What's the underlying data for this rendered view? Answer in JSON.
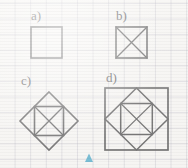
{
  "page": {
    "background_color": "#f8f7f5",
    "grid_color": "#9694aa",
    "grid_spacing_px": 15.6,
    "ink_color": "#2e2e30",
    "marker_color": "#2f9ec4"
  },
  "labels": {
    "a": "a)",
    "b": "b)",
    "c": "c)",
    "d": "d)"
  },
  "figures": [
    {
      "id": "a",
      "name": "plain-square",
      "description": "A plain upright square outline.",
      "bounds": {
        "x": 31,
        "y": 27,
        "width": 31,
        "height": 31
      },
      "elements": [
        "outer-square"
      ]
    },
    {
      "id": "b",
      "name": "square-with-diagonals",
      "description": "An upright square with both diagonals drawn forming an X.",
      "bounds": {
        "x": 116,
        "y": 27,
        "width": 31,
        "height": 31
      },
      "elements": [
        "outer-square",
        "diagonal-x"
      ]
    },
    {
      "id": "c",
      "name": "diamond-with-inscribed-square-and-x",
      "description": "A diamond (square rotated 45 degrees) containing an inscribed upright square whose corners touch the diamond edge midpoints, with both diagonals of the inner square drawn.",
      "bounds": {
        "x": 20,
        "y": 92,
        "width": 58,
        "height": 58
      },
      "elements": [
        "diamond",
        "inner-square",
        "diagonal-x"
      ]
    },
    {
      "id": "d",
      "name": "square-diamond-square-with-x",
      "description": "An outer upright square containing an inscribed diamond, which in turn contains a smaller upright square with both diagonals drawn.",
      "bounds": {
        "x": 105,
        "y": 88,
        "width": 63,
        "height": 62
      },
      "elements": [
        "outer-square",
        "diamond",
        "inner-square",
        "diagonal-x"
      ]
    }
  ],
  "marker": {
    "name": "page-marker-triangle",
    "shape": "triangle-up",
    "color": "#2f9ec4",
    "x": 88,
    "y": 157,
    "size": 8
  }
}
